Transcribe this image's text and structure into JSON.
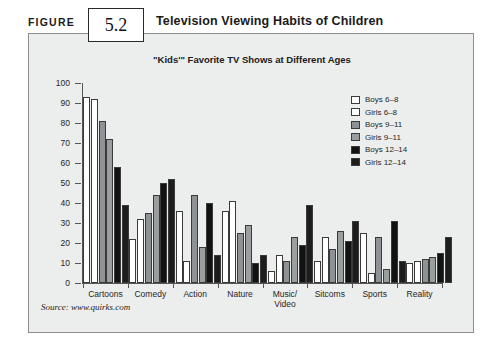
{
  "figure": {
    "label": "FIGURE",
    "number": "5.2",
    "title": "Television Viewing Habits of Children"
  },
  "source": "Source: www.quirks.com",
  "chart_data": {
    "type": "bar",
    "title": "\"Kids'\" Favorite TV Shows at Different Ages",
    "xlabel": "",
    "ylabel": "",
    "ylim": [
      0,
      100
    ],
    "yticks": [
      0,
      10,
      20,
      30,
      40,
      50,
      60,
      70,
      80,
      90,
      100
    ],
    "grid": false,
    "legend_position": "inside-top-right",
    "categories": [
      "Cartoons",
      "Comedy",
      "Action",
      "Nature",
      "Music/\nVideo",
      "Sitcoms",
      "Sports",
      "Reality"
    ],
    "series": [
      {
        "name": "Boys 6-8",
        "color": "#ffffff",
        "values": [
          93,
          22,
          36,
          36,
          6,
          11,
          25,
          10
        ]
      },
      {
        "name": "Girls 6-8",
        "color": "#ffffff",
        "values": [
          92,
          32,
          11,
          41,
          14,
          23,
          5,
          11
        ]
      },
      {
        "name": "Boys 9-11",
        "color": "#8f9294",
        "values": [
          81,
          35,
          44,
          25,
          11,
          17,
          23,
          12
        ]
      },
      {
        "name": "Girls 9-11",
        "color": "#9b9e9f",
        "values": [
          72,
          44,
          18,
          29,
          23,
          26,
          7,
          13
        ]
      },
      {
        "name": "Boys 12-14",
        "color": "#121212",
        "values": [
          58,
          50,
          40,
          10,
          19,
          21,
          31,
          15
        ]
      },
      {
        "name": "Girls 12-14",
        "color": "#1d1d1d",
        "values": [
          39,
          52,
          14,
          14,
          39,
          31,
          11,
          23
        ]
      }
    ]
  }
}
